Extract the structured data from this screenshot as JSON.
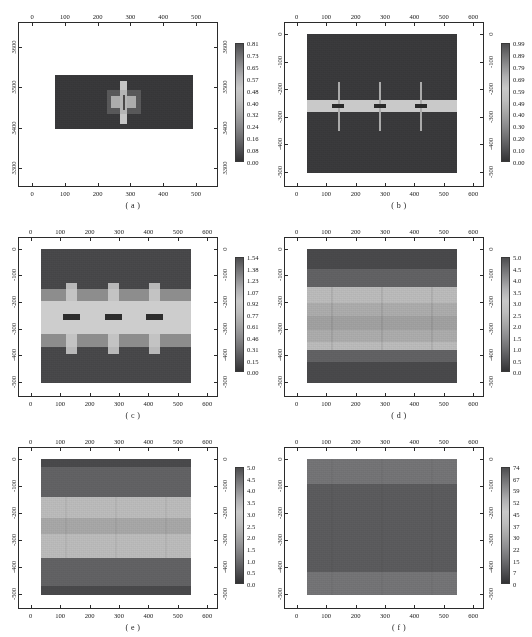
{
  "figure": {
    "panel_count": 6,
    "background": "#ffffff",
    "axis_color": "#2b2b2b"
  },
  "chart_data": [
    {
      "type": "heatmap",
      "panel": "a",
      "caption": "( a )",
      "title": "",
      "xlabel": "",
      "ylabel": "",
      "xlim": [
        -40,
        570
      ],
      "ylim": [
        3250,
        3660
      ],
      "xticks": [
        0,
        100,
        200,
        300,
        400,
        500
      ],
      "xticklabels": [
        "0",
        "100",
        "200",
        "300",
        "400",
        "500"
      ],
      "yticks": [
        3300,
        3400,
        3500,
        3600
      ],
      "yticklabels": [
        "3300",
        "3400",
        "3500",
        "3600"
      ],
      "y_axis_inverted": false,
      "grid": false,
      "data_extent": {
        "x0": 0,
        "x1": 550,
        "y0": 3390,
        "y1": 3520
      },
      "background_value": 0.1,
      "features": [
        {
          "shape": "cross",
          "x": 272,
          "y": 3455,
          "peak_value": 0.81,
          "note": "single cross-shaped high-amplitude anomaly with dark core line"
        }
      ],
      "colorbar": {
        "ticklabels": [
          "0.81",
          "0.73",
          "0.65",
          "0.57",
          "0.48",
          "0.40",
          "0.32",
          "0.24",
          "0.16",
          "0.08",
          "0.00"
        ],
        "vmin": 0.0,
        "vmax": 0.81,
        "orientation": "vertical",
        "position": "right"
      }
    },
    {
      "type": "heatmap",
      "panel": "b",
      "caption": "( b )",
      "title": "",
      "xlabel": "",
      "ylabel": "",
      "xlim": [
        -40,
        640
      ],
      "ylim": [
        -560,
        40
      ],
      "xticks": [
        0,
        100,
        200,
        300,
        400,
        500,
        600
      ],
      "xticklabels": [
        "0",
        "100",
        "200",
        "300",
        "400",
        "500",
        "600"
      ],
      "yticks": [
        0,
        -100,
        -200,
        -300,
        -400,
        -500
      ],
      "yticklabels": [
        "0",
        "-100",
        "-200",
        "-300",
        "-400",
        "-500"
      ],
      "y_axis_inverted": true,
      "grid": false,
      "data_extent": {
        "x0": 0,
        "x1": 550,
        "y0": -540,
        "y1": 0
      },
      "background_value": 0.1,
      "band": {
        "y_center": -280,
        "y_thickness": 45,
        "value": 0.69,
        "note": "bright horizontal layer"
      },
      "features": [
        {
          "shape": "star",
          "x": 120,
          "y": -280,
          "peak_value": 0.99
        },
        {
          "shape": "star",
          "x": 270,
          "y": -280,
          "peak_value": 0.99
        },
        {
          "shape": "star",
          "x": 415,
          "y": -280,
          "peak_value": 0.99
        }
      ],
      "colorbar": {
        "ticklabels": [
          "0.99",
          "0.89",
          "0.79",
          "0.69",
          "0.59",
          "0.49",
          "0.40",
          "0.30",
          "0.20",
          "0.10",
          "0.00"
        ],
        "vmin": 0.0,
        "vmax": 0.99,
        "orientation": "vertical",
        "position": "right"
      }
    },
    {
      "type": "heatmap",
      "panel": "c",
      "caption": "( c )",
      "title": "",
      "xlabel": "",
      "ylabel": "",
      "xlim": [
        -40,
        640
      ],
      "ylim": [
        -560,
        40
      ],
      "xticks": [
        0,
        100,
        200,
        300,
        400,
        500,
        600
      ],
      "xticklabels": [
        "0",
        "100",
        "200",
        "300",
        "400",
        "500",
        "600"
      ],
      "yticks": [
        0,
        -100,
        -200,
        -300,
        -400,
        -500
      ],
      "yticklabels": [
        "0",
        "-100",
        "-200",
        "-300",
        "-400",
        "-500"
      ],
      "y_axis_inverted": true,
      "grid": false,
      "data_extent": {
        "x0": 0,
        "x1": 550,
        "y0": -540,
        "y1": 0
      },
      "layers": [
        {
          "y_top": 0,
          "y_bottom": -165,
          "value": 0.31
        },
        {
          "y_top": -165,
          "y_bottom": -215,
          "value": 0.92
        },
        {
          "y_top": -215,
          "y_bottom": -345,
          "value": 1.23
        },
        {
          "y_top": -345,
          "y_bottom": -395,
          "value": 0.92
        },
        {
          "y_top": -395,
          "y_bottom": -540,
          "value": 0.31
        }
      ],
      "features": [
        {
          "shape": "column",
          "x": 120,
          "y": -280,
          "peak_value": 1.54,
          "dark_core_value": 0.15
        },
        {
          "shape": "column",
          "x": 270,
          "y": -280,
          "peak_value": 1.54,
          "dark_core_value": 0.15
        },
        {
          "shape": "column",
          "x": 415,
          "y": -280,
          "peak_value": 1.54,
          "dark_core_value": 0.15
        }
      ],
      "colorbar": {
        "ticklabels": [
          "1.54",
          "1.38",
          "1.23",
          "1.07",
          "0.92",
          "0.77",
          "0.61",
          "0.46",
          "0.31",
          "0.15",
          "0.00"
        ],
        "vmin": 0.0,
        "vmax": 1.54,
        "orientation": "vertical",
        "position": "right"
      }
    },
    {
      "type": "heatmap",
      "panel": "d",
      "caption": "( d )",
      "title": "",
      "xlabel": "",
      "ylabel": "",
      "xlim": [
        -40,
        640
      ],
      "ylim": [
        -560,
        40
      ],
      "xticks": [
        0,
        100,
        200,
        300,
        400,
        500,
        600
      ],
      "xticklabels": [
        "0",
        "100",
        "200",
        "300",
        "400",
        "500",
        "600"
      ],
      "yticks": [
        0,
        -100,
        -200,
        -300,
        -400,
        -500
      ],
      "yticklabels": [
        "0",
        "-100",
        "-200",
        "-300",
        "-400",
        "-500"
      ],
      "y_axis_inverted": true,
      "grid": false,
      "data_extent": {
        "x0": 0,
        "x1": 550,
        "y0": -540,
        "y1": 0
      },
      "layers": [
        {
          "y_top": 0,
          "y_bottom": -80,
          "value": 1.0
        },
        {
          "y_top": -80,
          "y_bottom": -150,
          "value": 1.5
        },
        {
          "y_top": -150,
          "y_bottom": -215,
          "value": 3.5
        },
        {
          "y_top": -215,
          "y_bottom": -265,
          "value": 3.0
        },
        {
          "y_top": -265,
          "y_bottom": -320,
          "value": 2.5
        },
        {
          "y_top": -320,
          "y_bottom": -370,
          "value": 3.0
        },
        {
          "y_top": -370,
          "y_bottom": -400,
          "value": 3.5
        },
        {
          "y_top": -400,
          "y_bottom": -450,
          "value": 1.5
        },
        {
          "y_top": -450,
          "y_bottom": -540,
          "value": 1.0
        }
      ],
      "colorbar": {
        "ticklabels": [
          "5.0",
          "4.5",
          "4.0",
          "3.5",
          "3.0",
          "2.5",
          "2.0",
          "1.5",
          "1.0",
          "0.5",
          "0.0"
        ],
        "vmin": 0.0,
        "vmax": 5.0,
        "orientation": "vertical",
        "position": "right"
      }
    },
    {
      "type": "heatmap",
      "panel": "e",
      "caption": "( e )",
      "title": "",
      "xlabel": "",
      "ylabel": "",
      "xlim": [
        -40,
        640
      ],
      "ylim": [
        -560,
        40
      ],
      "xticks": [
        0,
        100,
        200,
        300,
        400,
        500,
        600
      ],
      "xticklabels": [
        "0",
        "100",
        "200",
        "300",
        "400",
        "500",
        "600"
      ],
      "yticks": [
        0,
        -100,
        -200,
        -300,
        -400,
        -500
      ],
      "yticklabels": [
        "0",
        "-100",
        "-200",
        "-300",
        "-400",
        "-500"
      ],
      "y_axis_inverted": true,
      "grid": false,
      "data_extent": {
        "x0": 0,
        "x1": 550,
        "y0": -540,
        "y1": 0
      },
      "layers": [
        {
          "y_top": 0,
          "y_bottom": -30,
          "value": 1.0
        },
        {
          "y_top": -30,
          "y_bottom": -150,
          "value": 1.5
        },
        {
          "y_top": -150,
          "y_bottom": -235,
          "value": 3.5
        },
        {
          "y_top": -235,
          "y_bottom": -300,
          "value": 3.0
        },
        {
          "y_top": -300,
          "y_bottom": -395,
          "value": 3.5
        },
        {
          "y_top": -395,
          "y_bottom": -500,
          "value": 1.5
        },
        {
          "y_top": -500,
          "y_bottom": -540,
          "value": 1.0
        }
      ],
      "colorbar": {
        "ticklabels": [
          "5.0",
          "4.5",
          "4.0",
          "3.5",
          "3.0",
          "2.5",
          "2.0",
          "1.5",
          "1.0",
          "0.5",
          "0.0"
        ],
        "vmin": 0.0,
        "vmax": 5.0,
        "orientation": "vertical",
        "position": "right"
      }
    },
    {
      "type": "heatmap",
      "panel": "f",
      "caption": "( f )",
      "title": "",
      "xlabel": "",
      "ylabel": "",
      "xlim": [
        -40,
        640
      ],
      "ylim": [
        -560,
        40
      ],
      "xticks": [
        0,
        100,
        200,
        300,
        400,
        500,
        600
      ],
      "xticklabels": [
        "0",
        "100",
        "200",
        "300",
        "400",
        "500",
        "600"
      ],
      "yticks": [
        0,
        -100,
        -200,
        -300,
        -400,
        -500
      ],
      "yticklabels": [
        "0",
        "-100",
        "-200",
        "-300",
        "-400",
        "-500"
      ],
      "y_axis_inverted": true,
      "grid": false,
      "data_extent": {
        "x0": 0,
        "x1": 550,
        "y0": -540,
        "y1": 0
      },
      "layers": [
        {
          "y_top": 0,
          "y_bottom": -95,
          "value": 37
        },
        {
          "y_top": -95,
          "y_bottom": -450,
          "value": 22
        },
        {
          "y_top": -450,
          "y_bottom": -540,
          "value": 37
        }
      ],
      "colorbar": {
        "ticklabels": [
          "74",
          "67",
          "59",
          "52",
          "45",
          "37",
          "30",
          "22",
          "15",
          "7",
          "0"
        ],
        "vmin": 0,
        "vmax": 74,
        "orientation": "vertical",
        "position": "right"
      }
    }
  ]
}
